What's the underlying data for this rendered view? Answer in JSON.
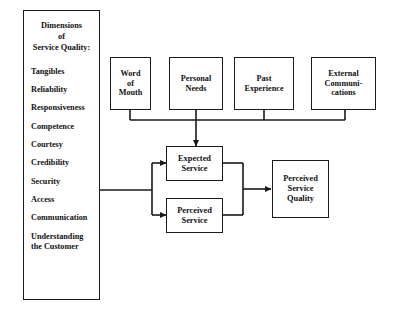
{
  "diagram": {
    "background_color": "#ffffff",
    "line_color": "#1a1a1a",
    "text_color": "#111111",
    "dimensions_panel": {
      "heading_line1": "Dimensions",
      "heading_line2": "of",
      "heading_line3": "Service Quality:",
      "items": [
        {
          "label": "Tangibles"
        },
        {
          "label": "Reliability"
        },
        {
          "label": "Responsiveness"
        },
        {
          "label": "Competence"
        },
        {
          "label": "Courtesy"
        },
        {
          "label": "Credibility"
        },
        {
          "label": "Security"
        },
        {
          "label": "Access"
        },
        {
          "label": "Communication"
        },
        {
          "label": "Understanding the Customer",
          "line1": "Understanding",
          "line2": "the Customer"
        }
      ]
    },
    "top_boxes": [
      {
        "line1": "Word",
        "line2": "of",
        "line3": "Mouth"
      },
      {
        "line1": "Personal",
        "line2": "Needs"
      },
      {
        "line1": "Past",
        "line2": "Experience"
      },
      {
        "line1": "External",
        "line2": "Communi-",
        "line3": "cations"
      }
    ],
    "mid_boxes": [
      {
        "line1": "Expected",
        "line2": "Service"
      },
      {
        "line1": "Perceived",
        "line2": "Service"
      }
    ],
    "outcome_box": {
      "line1": "Perceived",
      "line2": "Service",
      "line3": "Quality"
    }
  }
}
